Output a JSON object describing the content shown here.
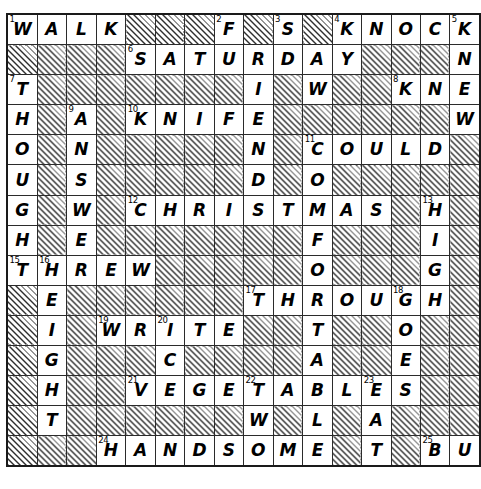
{
  "puzzle": {
    "type": "crossword",
    "rows": 15,
    "cols": 16,
    "block_style": "diagonal-hatch",
    "colors": {
      "grid_line": "#2b2b2b",
      "border": "#1a1a1a",
      "letter": "#000000",
      "block_hatch": "#2f2f2f",
      "background": "#ffffff"
    },
    "answers": [
      "WALK",
      "SATURDAY",
      "KNOCK",
      "KNIFE",
      "COULD",
      "CHRISTMAS",
      "THREW",
      "THROUGH",
      "WRITE",
      "VEGETABLES",
      "HANDSOME",
      "BUY",
      "FOUND",
      "SNOWING",
      "COULD",
      "HOUGHT",
      "THOUGHT",
      "WELCOME"
    ],
    "cells": [
      [
        {
          "n": "1",
          "l": "W"
        },
        {
          "l": "A"
        },
        {
          "l": "L"
        },
        {
          "l": "K"
        },
        {
          "b": true
        },
        {
          "b": true
        },
        {
          "b": true
        },
        {
          "n": "2",
          "l": "F"
        },
        {
          "b": true
        },
        {
          "n": "3",
          "l": "S"
        },
        {
          "b": true
        },
        {
          "n": "4",
          "l": "K"
        },
        {
          "l": "N"
        },
        {
          "l": "O"
        },
        {
          "l": "C"
        },
        {
          "n": "5",
          "l": "K"
        }
      ],
      [
        {
          "b": true
        },
        {
          "b": true
        },
        {
          "b": true
        },
        {
          "b": true
        },
        {
          "n": "6",
          "l": "S"
        },
        {
          "l": "A"
        },
        {
          "l": "T"
        },
        {
          "l": "U"
        },
        {
          "l": "R"
        },
        {
          "l": "D"
        },
        {
          "l": "A"
        },
        {
          "l": "Y"
        },
        {
          "b": true
        },
        {
          "b": true
        },
        {
          "b": true
        },
        {
          "l": "N"
        }
      ],
      [
        {
          "n": "7",
          "l": "T"
        },
        {
          "b": true
        },
        {
          "b": true
        },
        {
          "b": true
        },
        {
          "b": true
        },
        {
          "b": true
        },
        {
          "b": true
        },
        {
          "b": true
        },
        {
          "l": "I"
        },
        {
          "b": true
        },
        {
          "l": "W"
        },
        {
          "b": true
        },
        {
          "b": true
        },
        {
          "n": "8",
          "l": "K"
        },
        {
          "l": "N"
        },
        {
          "l": "E"
        }
      ],
      [
        {
          "l": "H"
        },
        {
          "b": true
        },
        {
          "n": "9",
          "l": "A"
        },
        {
          "b": true
        },
        {
          "n": "10",
          "l": "K"
        },
        {
          "l": "N"
        },
        {
          "l": "I"
        },
        {
          "l": "F"
        },
        {
          "l": "E"
        },
        {
          "b": true
        },
        {
          "b": true
        },
        {
          "b": true
        },
        {
          "b": true
        },
        {
          "b": true
        },
        {
          "b": true
        },
        {
          "l": "W"
        }
      ],
      [
        {
          "l": "O"
        },
        {
          "b": true
        },
        {
          "l": "N"
        },
        {
          "b": true
        },
        {
          "b": true
        },
        {
          "b": true
        },
        {
          "b": true
        },
        {
          "b": true
        },
        {
          "l": "N"
        },
        {
          "b": true
        },
        {
          "n": "11",
          "l": "C"
        },
        {
          "l": "O"
        },
        {
          "l": "U"
        },
        {
          "l": "L"
        },
        {
          "l": "D"
        },
        {
          "b": true
        }
      ],
      [
        {
          "l": "U"
        },
        {
          "b": true
        },
        {
          "l": "S"
        },
        {
          "b": true
        },
        {
          "b": true
        },
        {
          "b": true
        },
        {
          "b": true
        },
        {
          "b": true
        },
        {
          "l": "D"
        },
        {
          "b": true
        },
        {
          "l": "O"
        },
        {
          "b": true
        },
        {
          "b": true
        },
        {
          "b": true
        },
        {
          "b": true
        },
        {
          "b": true
        }
      ],
      [
        {
          "l": "G"
        },
        {
          "b": true
        },
        {
          "l": "W"
        },
        {
          "b": true
        },
        {
          "n": "12",
          "l": "C"
        },
        {
          "l": "H"
        },
        {
          "l": "R"
        },
        {
          "l": "I"
        },
        {
          "l": "S"
        },
        {
          "l": "T"
        },
        {
          "l": "M"
        },
        {
          "l": "A"
        },
        {
          "l": "S"
        },
        {
          "b": true
        },
        {
          "n": "13",
          "l": "H"
        },
        {
          "b": true
        }
      ],
      [
        {
          "l": "H"
        },
        {
          "b": true
        },
        {
          "l": "E"
        },
        {
          "b": true
        },
        {
          "b": true
        },
        {
          "b": true
        },
        {
          "b": true
        },
        {
          "b": true
        },
        {
          "b": true
        },
        {
          "b": true
        },
        {
          "l": "F"
        },
        {
          "b": true
        },
        {
          "b": true
        },
        {
          "b": true
        },
        {
          "l": "I"
        },
        {
          "b": true
        }
      ],
      [
        {
          "n": "15",
          "l": "T"
        },
        {
          "n": "16",
          "l": "H"
        },
        {
          "l": "R"
        },
        {
          "l": "E"
        },
        {
          "l": "W"
        },
        {
          "b": true
        },
        {
          "b": true
        },
        {
          "b": true
        },
        {
          "b": true
        },
        {
          "b": true
        },
        {
          "l": "O"
        },
        {
          "b": true
        },
        {
          "b": true
        },
        {
          "b": true
        },
        {
          "l": "G"
        },
        {
          "b": true
        }
      ],
      [
        {
          "b": true
        },
        {
          "l": "E"
        },
        {
          "b": true
        },
        {
          "b": true
        },
        {
          "b": true
        },
        {
          "b": true
        },
        {
          "b": true
        },
        {
          "b": true
        },
        {
          "n": "17",
          "l": "T"
        },
        {
          "l": "H"
        },
        {
          "l": "R"
        },
        {
          "l": "O"
        },
        {
          "l": "U"
        },
        {
          "n": "18",
          "l": "G"
        },
        {
          "l": "H"
        },
        {
          "b": true
        }
      ],
      [
        {
          "b": true
        },
        {
          "l": "I"
        },
        {
          "b": true
        },
        {
          "n": "19",
          "l": "W"
        },
        {
          "l": "R"
        },
        {
          "n": "20",
          "l": "I"
        },
        {
          "l": "T"
        },
        {
          "l": "E"
        },
        {
          "b": true
        },
        {
          "b": true
        },
        {
          "l": "T"
        },
        {
          "b": true
        },
        {
          "b": true
        },
        {
          "l": "O"
        },
        {
          "b": true
        },
        {
          "b": true
        }
      ],
      [
        {
          "b": true
        },
        {
          "l": "G"
        },
        {
          "b": true
        },
        {
          "b": true
        },
        {
          "b": true
        },
        {
          "l": "C"
        },
        {
          "b": true
        },
        {
          "b": true
        },
        {
          "b": true
        },
        {
          "b": true
        },
        {
          "l": "A"
        },
        {
          "b": true
        },
        {
          "b": true
        },
        {
          "l": "E"
        },
        {
          "b": true
        },
        {
          "b": true
        }
      ],
      [
        {
          "b": true
        },
        {
          "l": "H"
        },
        {
          "b": true
        },
        {
          "b": true
        },
        {
          "n": "21",
          "l": "V"
        },
        {
          "l": "E"
        },
        {
          "l": "G"
        },
        {
          "l": "E"
        },
        {
          "n": "22",
          "l": "T"
        },
        {
          "l": "A"
        },
        {
          "l": "B"
        },
        {
          "l": "L"
        },
        {
          "n": "23",
          "l": "E"
        },
        {
          "l": "S"
        },
        {
          "b": true
        },
        {
          "b": true
        }
      ],
      [
        {
          "b": true
        },
        {
          "l": "T"
        },
        {
          "b": true
        },
        {
          "b": true
        },
        {
          "b": true
        },
        {
          "b": true
        },
        {
          "b": true
        },
        {
          "b": true
        },
        {
          "l": "W"
        },
        {
          "b": true
        },
        {
          "l": "L"
        },
        {
          "b": true
        },
        {
          "l": "A"
        },
        {
          "b": true
        },
        {
          "b": true
        },
        {
          "b": true
        }
      ],
      [
        {
          "b": true
        },
        {
          "b": true
        },
        {
          "b": true
        },
        {
          "n": "24",
          "l": "H"
        },
        {
          "l": "A"
        },
        {
          "l": "N"
        },
        {
          "l": "D"
        },
        {
          "l": "S"
        },
        {
          "l": "O"
        },
        {
          "l": "M"
        },
        {
          "l": "E"
        },
        {
          "b": true
        },
        {
          "l": "T"
        },
        {
          "b": true
        },
        {
          "n": "25",
          "l": "B"
        },
        {
          "l": "U"
        }
      ]
    ],
    "extra_cells": {
      "row1_col17": "",
      "row3_col16": "E",
      "row4_col16": "W",
      "row5_col16": "",
      "row15_col16": "Y"
    },
    "right_column_letters": {
      "r3": "E",
      "r9": "D",
      "r10": "N",
      "r11": "E",
      "r12": "S",
      "r13": "D",
      "r14": "A",
      "r15": "Y"
    }
  }
}
